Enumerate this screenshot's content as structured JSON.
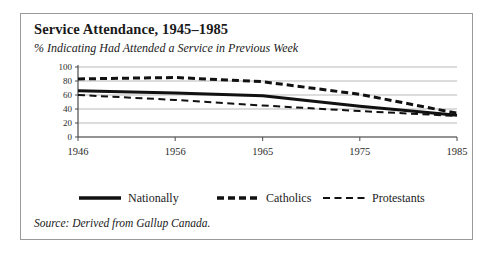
{
  "figure": {
    "title": "Service Attendance, 1945–1985",
    "subtitle": "% Indicating Had Attended a Service in Previous Week",
    "source": "Source: Derived from Gallup Canada.",
    "border_color": "#9a9a9a",
    "background": "#ffffff",
    "ink_color": "#111111",
    "grid_color": "#b9b9b9"
  },
  "chart_data": {
    "type": "line",
    "title": "Service Attendance, 1945–1985",
    "subtitle": "% Indicating Had Attended a Service in Previous Week",
    "xlabel": "",
    "ylabel": "",
    "x": [
      1946,
      1956,
      1965,
      1975,
      1985
    ],
    "categories": [
      "1946",
      "1956",
      "1965",
      "1975",
      "1985"
    ],
    "xlim": [
      1946,
      1985
    ],
    "ylim": [
      0,
      100
    ],
    "yticks": [
      0,
      20,
      40,
      60,
      80,
      100
    ],
    "ytick_labels": [
      "0",
      "20",
      "40",
      "60",
      "80",
      "100"
    ],
    "xtick_labels": [
      "1946",
      "1956",
      "1965",
      "1975",
      "1985"
    ],
    "grid": "horizontal",
    "legend_position": "below-plot",
    "series": [
      {
        "name": "Nationally",
        "style": "solid",
        "linewidth": 3,
        "color": "#111111",
        "values": [
          66,
          63,
          59,
          44,
          31
        ]
      },
      {
        "name": "Catholics",
        "style": "dashed-thick",
        "linewidth": 3,
        "color": "#111111",
        "values": [
          83,
          85,
          79,
          61,
          34
        ]
      },
      {
        "name": "Protestants",
        "style": "dashed-thin",
        "linewidth": 2,
        "color": "#111111",
        "values": [
          60,
          53,
          45,
          37,
          30
        ]
      }
    ]
  },
  "legend": {
    "entries": [
      {
        "label": "Nationally"
      },
      {
        "label": "Catholics"
      },
      {
        "label": "Protestants"
      }
    ]
  }
}
